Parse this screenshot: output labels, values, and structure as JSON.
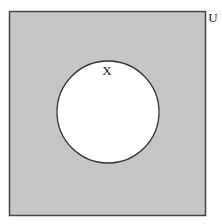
{
  "diagram": {
    "type": "venn",
    "universe": {
      "label": "U",
      "fill": "#c6c6c6",
      "stroke": "#444444",
      "shaded": true
    },
    "sets": [
      {
        "label": "X",
        "fill": "#ffffff",
        "stroke": "#333333",
        "shaded": false
      }
    ],
    "shaded_region": "X'"
  }
}
